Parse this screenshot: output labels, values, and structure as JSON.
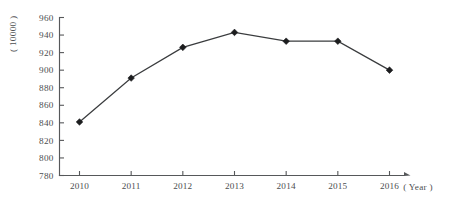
{
  "chart_data": {
    "type": "line",
    "title": "",
    "subtitle": "",
    "xlabel": "( Year )",
    "ylabel": "( 10000 )",
    "categories": [
      "2010",
      "2011",
      "2012",
      "2013",
      "2014",
      "2015",
      "2016"
    ],
    "x": [
      2010,
      2011,
      2012,
      2013,
      2014,
      2015,
      2016
    ],
    "values": [
      841,
      891,
      926,
      943,
      933,
      933,
      900
    ],
    "series": [
      {
        "name": "",
        "values": [
          841,
          891,
          926,
          943,
          933,
          933,
          900
        ]
      }
    ],
    "ylim": [
      780,
      960
    ],
    "xlim": [
      2010,
      2016
    ],
    "y_ticks": [
      780,
      800,
      820,
      840,
      860,
      880,
      900,
      920,
      940,
      960
    ],
    "y_tick_labels": [
      "780",
      "800",
      "820",
      "840",
      "860",
      "880",
      "900",
      "920",
      "940",
      "960"
    ],
    "x_tick_labels": [
      "2010",
      "2011",
      "2012",
      "2013",
      "2014",
      "2015",
      "2016"
    ],
    "grid": false,
    "legend": false,
    "legend_position": "none",
    "marker": "diamond",
    "line_color": "#3a3c3e",
    "marker_color": "#1c1d1f",
    "axis_color": "#56585a",
    "background_color": "#ffffff",
    "x_axis_arrow": true,
    "y_axis_arrow": false
  },
  "axes": {
    "y_unit_text": "( 10000 )",
    "x_name_text": "( Year )"
  }
}
